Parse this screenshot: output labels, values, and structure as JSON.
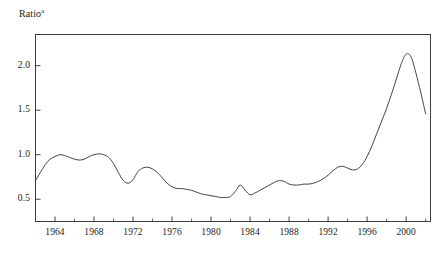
{
  "chart_data": {
    "type": "line",
    "title": "",
    "ylabel": "Ratio",
    "ylabel_superscript": "a",
    "xlabel": "",
    "xlim": [
      1962,
      2002.5
    ],
    "ylim": [
      0.25,
      2.35
    ],
    "grid": false,
    "legend": null,
    "yticks": [
      0.5,
      1.0,
      1.5,
      2.0
    ],
    "ytick_labels": [
      "0.5",
      "1.0",
      "1.5",
      "2.0"
    ],
    "xticks": [
      1964,
      1968,
      1972,
      1976,
      1980,
      1984,
      1988,
      1992,
      1996,
      2000
    ],
    "xtick_labels": [
      "1964",
      "1968",
      "1972",
      "1976",
      "1980",
      "1984",
      "1988",
      "1992",
      "1996",
      "2000"
    ],
    "xticks_minor": [
      1962,
      1966,
      1970,
      1974,
      1978,
      1982,
      1986,
      1990,
      1994,
      1998,
      2002
    ],
    "series": [
      {
        "name": "Ratio",
        "color": "#3a3a3a",
        "x": [
          1962.0,
          1962.5,
          1963.0,
          1963.5,
          1964.0,
          1964.5,
          1965.0,
          1965.5,
          1966.0,
          1966.5,
          1967.0,
          1967.5,
          1968.0,
          1968.5,
          1969.0,
          1969.5,
          1970.0,
          1970.5,
          1971.0,
          1971.5,
          1972.0,
          1972.5,
          1973.0,
          1973.5,
          1974.0,
          1974.5,
          1975.0,
          1975.5,
          1976.0,
          1976.5,
          1977.0,
          1977.5,
          1978.0,
          1978.5,
          1979.0,
          1979.5,
          1980.0,
          1980.5,
          1981.0,
          1981.5,
          1982.0,
          1982.5,
          1983.0,
          1983.5,
          1984.0,
          1984.5,
          1985.0,
          1985.5,
          1986.0,
          1986.5,
          1987.0,
          1987.5,
          1988.0,
          1988.5,
          1989.0,
          1989.5,
          1990.0,
          1990.5,
          1991.0,
          1991.5,
          1992.0,
          1992.5,
          1993.0,
          1993.5,
          1994.0,
          1994.5,
          1995.0,
          1995.5,
          1996.0,
          1996.5,
          1997.0,
          1997.5,
          1998.0,
          1998.5,
          1999.0,
          1999.5,
          2000.0,
          2000.5,
          2001.0,
          2001.5,
          2002.0
        ],
        "values": [
          0.71,
          0.8,
          0.89,
          0.95,
          0.98,
          1.0,
          0.99,
          0.97,
          0.95,
          0.94,
          0.95,
          0.98,
          1.0,
          1.01,
          1.0,
          0.97,
          0.9,
          0.8,
          0.71,
          0.68,
          0.72,
          0.81,
          0.85,
          0.86,
          0.84,
          0.8,
          0.74,
          0.68,
          0.64,
          0.62,
          0.62,
          0.61,
          0.6,
          0.58,
          0.56,
          0.55,
          0.54,
          0.53,
          0.52,
          0.52,
          0.53,
          0.59,
          0.66,
          0.6,
          0.55,
          0.57,
          0.6,
          0.63,
          0.66,
          0.69,
          0.71,
          0.7,
          0.67,
          0.66,
          0.66,
          0.67,
          0.67,
          0.68,
          0.7,
          0.73,
          0.77,
          0.82,
          0.86,
          0.87,
          0.85,
          0.83,
          0.84,
          0.89,
          0.98,
          1.1,
          1.24,
          1.38,
          1.52,
          1.68,
          1.85,
          2.02,
          2.13,
          2.1,
          1.92,
          1.7,
          1.46
        ]
      }
    ]
  }
}
